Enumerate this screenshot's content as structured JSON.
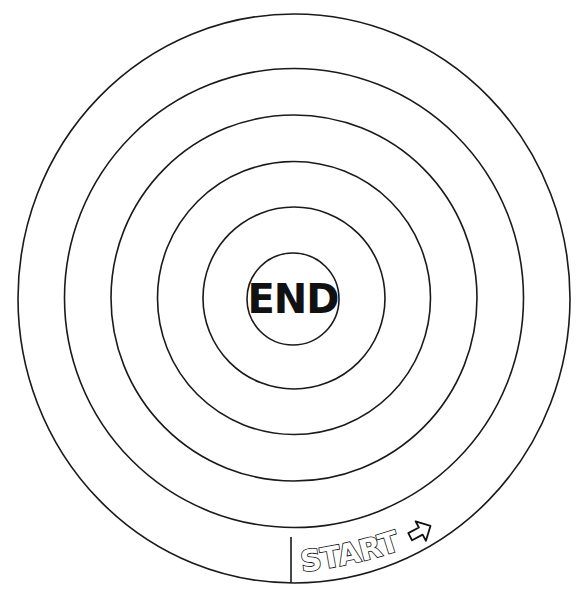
{
  "board": {
    "title": "Spiral race track game board",
    "ring_count": 6,
    "stroke_color": "#1a1a1a",
    "background_color": "#ffffff"
  },
  "center": {
    "label": "END"
  },
  "start": {
    "label": "START",
    "arrow_icon": "arrow-right-outline-icon",
    "arrow_direction": "counter-clockwise (pointing right/up along the outer lane)"
  }
}
